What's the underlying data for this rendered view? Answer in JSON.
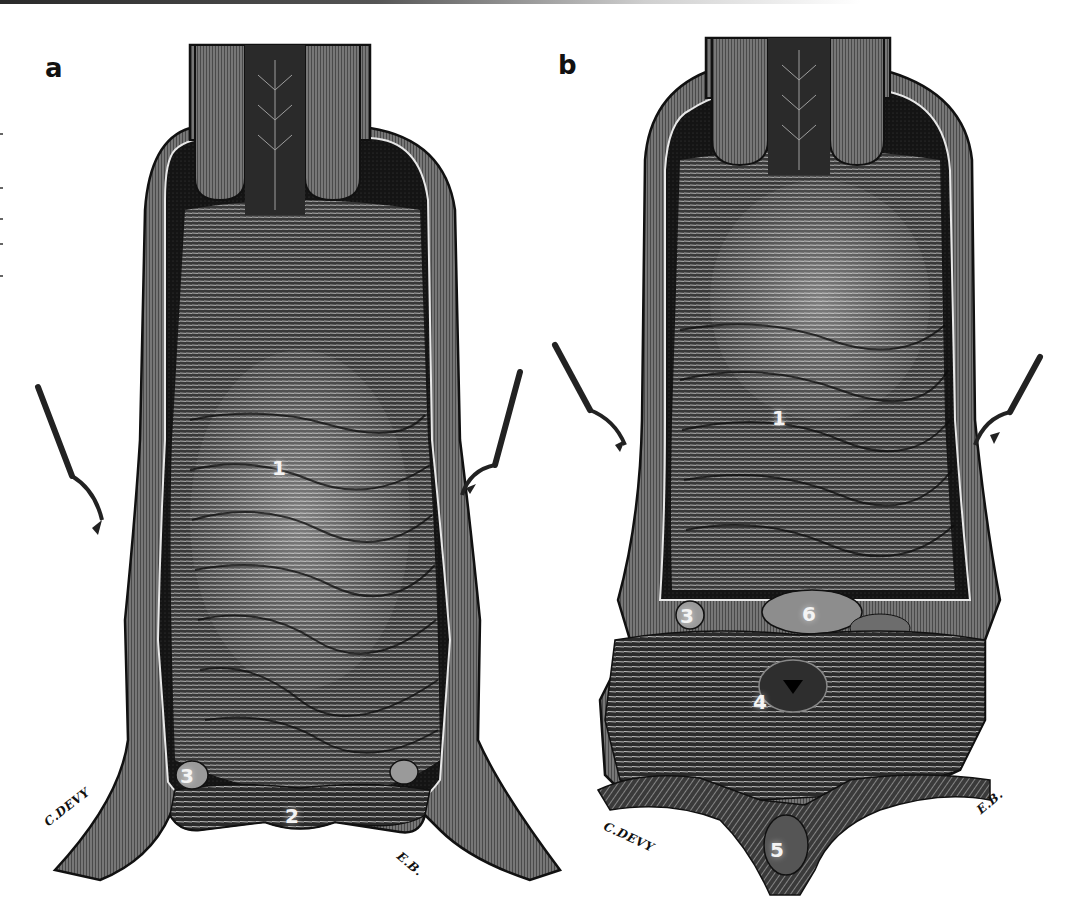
{
  "figure": {
    "colors": {
      "ink": "#111111",
      "mid_gray": "#555555",
      "light_highlight": "#e8e8e8",
      "paper": "#ffffff"
    },
    "panels": [
      {
        "id": "a",
        "letter": "a",
        "callouts": [
          {
            "label": "1",
            "x": 278,
            "y": 457
          },
          {
            "label": "2",
            "x": 291,
            "y": 805
          },
          {
            "label": "3",
            "x": 185,
            "y": 767
          },
          {
            "label": "3",
            "x": 393,
            "y": 765
          }
        ],
        "signatures": {
          "left": "C.DEVY",
          "right": "E.B."
        }
      },
      {
        "id": "b",
        "letter": "b",
        "callouts": [
          {
            "label": "1",
            "x": 778,
            "y": 410
          },
          {
            "label": "3",
            "x": 684,
            "y": 605
          },
          {
            "label": "6",
            "x": 806,
            "y": 603
          },
          {
            "label": "4",
            "x": 757,
            "y": 693
          },
          {
            "label": "5",
            "x": 774,
            "y": 842
          }
        ],
        "signatures": {
          "left": "C.DEVY",
          "right": "E.B."
        }
      }
    ]
  }
}
